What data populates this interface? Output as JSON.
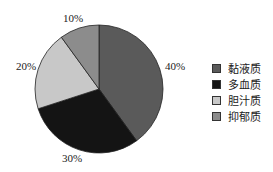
{
  "chart_data": {
    "type": "pie",
    "title": "",
    "categories": [
      "黏液质",
      "多血质",
      "胆汁质",
      "抑郁质"
    ],
    "values": [
      40,
      30,
      20,
      10
    ],
    "labels": [
      "40%",
      "30%",
      "20%",
      "10%"
    ],
    "colors": [
      "#5a5a5a",
      "#141414",
      "#c8c8c8",
      "#8c8c8c"
    ],
    "start_angle": "12 o'clock",
    "direction": "clockwise",
    "legend_position": "right"
  },
  "legend": [
    {
      "label": "黏液质",
      "color": "#5a5a5a"
    },
    {
      "label": "多血质",
      "color": "#141414"
    },
    {
      "label": "胆汁质",
      "color": "#c8c8c8"
    },
    {
      "label": "抑郁质",
      "color": "#8c8c8c"
    }
  ],
  "slice_labels": {
    "s40": "40%",
    "s30": "30%",
    "s20": "20%",
    "s10": "10%"
  }
}
